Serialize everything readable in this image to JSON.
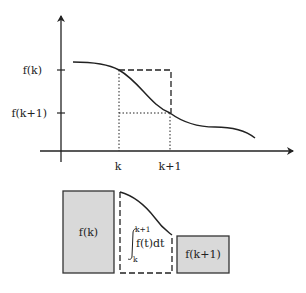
{
  "diagram": {
    "title": "",
    "axes": {
      "y_ticks": [
        {
          "label": "f(k)",
          "y": 70
        },
        {
          "label": "f(k+1)",
          "y": 113
        }
      ],
      "x_ticks": [
        {
          "label": "k",
          "x": 119
        },
        {
          "label": "k+1",
          "x": 170
        }
      ]
    },
    "lower": {
      "left_box_label": "f(k)",
      "integral_upper": "k+1",
      "integral_body": "f(t)dt",
      "integral_lower": "k",
      "right_box_label": "f(k+1)"
    },
    "colors": {
      "stroke": "#222222",
      "box_fill": "#d9d9d9"
    }
  }
}
